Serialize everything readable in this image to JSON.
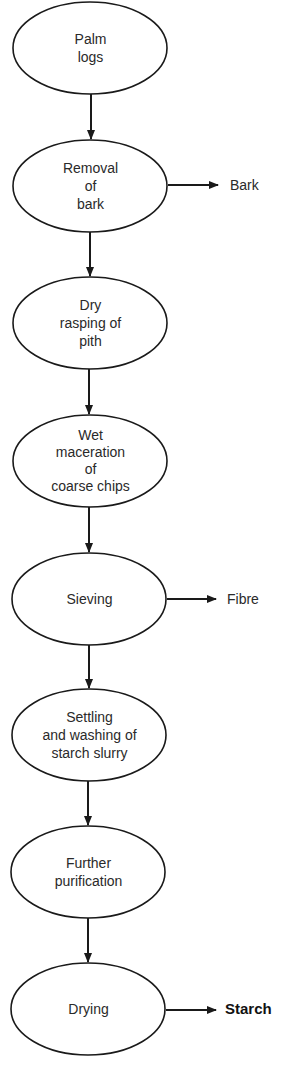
{
  "diagram": {
    "type": "process-flowchart",
    "nodes": [
      {
        "id": "palm-logs",
        "lines": [
          "Palm",
          "logs"
        ]
      },
      {
        "id": "removal-of-bark",
        "lines": [
          "Removal",
          "of",
          "bark"
        ]
      },
      {
        "id": "dry-rasping",
        "lines": [
          "Dry",
          "rasping of",
          "pith"
        ]
      },
      {
        "id": "wet-maceration",
        "lines": [
          "Wet",
          "maceration",
          "of",
          "coarse chips"
        ]
      },
      {
        "id": "sieving",
        "lines": [
          "Sieving"
        ]
      },
      {
        "id": "settling-washing",
        "lines": [
          "Settling",
          "and washing of",
          "starch slurry"
        ]
      },
      {
        "id": "further-purification",
        "lines": [
          "Further",
          "purification"
        ]
      },
      {
        "id": "drying",
        "lines": [
          "Drying"
        ]
      }
    ],
    "outputs": [
      {
        "from": "removal-of-bark",
        "label": "Bark",
        "bold": false
      },
      {
        "from": "sieving",
        "label": "Fibre",
        "bold": false
      },
      {
        "from": "drying",
        "label": "Starch",
        "bold": true
      }
    ],
    "edges": [
      [
        "palm-logs",
        "removal-of-bark"
      ],
      [
        "removal-of-bark",
        "dry-rasping"
      ],
      [
        "dry-rasping",
        "wet-maceration"
      ],
      [
        "wet-maceration",
        "sieving"
      ],
      [
        "sieving",
        "settling-washing"
      ],
      [
        "settling-washing",
        "further-purification"
      ],
      [
        "further-purification",
        "drying"
      ]
    ]
  }
}
